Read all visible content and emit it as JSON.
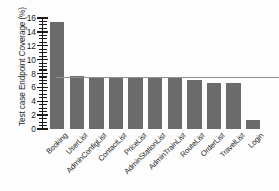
{
  "chart_data": {
    "type": "bar",
    "title": "",
    "xlabel": "",
    "ylabel": "Test case Endpoint Coverage (%)",
    "categories": [
      "Booking",
      "UserList",
      "AdminConfigList",
      "ContactList",
      "PriceList",
      "AdminStationList",
      "AdminTrainList",
      "RouteList",
      "OrderList",
      "TravelList",
      "Login"
    ],
    "values": [
      15.4,
      7.7,
      7.3,
      7.3,
      7.3,
      7.3,
      7.3,
      7.0,
      6.6,
      6.6,
      1.3
    ],
    "ylim": [
      0,
      16
    ],
    "ytick_labels": [
      "0",
      "2",
      "4",
      "6",
      "8",
      "10",
      "12",
      "14",
      "16"
    ],
    "ytick_values": [
      0,
      2,
      4,
      6,
      8,
      10,
      12,
      14,
      16
    ],
    "yminor_step": 0.5,
    "grid": false,
    "legend": null,
    "annotations": [
      {
        "name": "average-reference-line",
        "type": "hline",
        "value": 7.4,
        "color": "#8f8f8f"
      }
    ],
    "bar_color": "#6b6b6b",
    "axis_color": "#1c1c1c"
  }
}
